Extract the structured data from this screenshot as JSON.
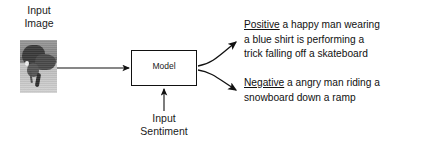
{
  "figure": {
    "background_color": "#ffffff",
    "line_color": "#111111"
  },
  "input_image": {
    "label_line1": "Input",
    "label_line2": "Image",
    "thumbnail_alt": "grayscale photo of a man on a skateboard"
  },
  "model": {
    "label": "Model"
  },
  "input_sentiment": {
    "label_line1": "Input",
    "label_line2": "Sentiment"
  },
  "outputs": [
    {
      "tag": "Positive",
      "text_lines": [
        "a happy man wearing",
        "a blue shirt is performing a",
        "trick falling off a skateboard"
      ],
      "full_text": "a happy man wearing a blue shirt is performing a trick falling off a skateboard"
    },
    {
      "tag": "Negative",
      "text_lines": [
        "a angry man riding a",
        "snowboard down a ramp"
      ],
      "full_text": "a angry man riding a snowboard down a ramp"
    }
  ]
}
